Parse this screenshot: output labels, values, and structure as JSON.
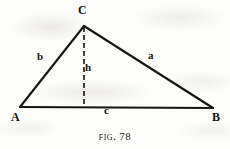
{
  "figure": {
    "caption_prefix": "Fig.",
    "caption_number": "78",
    "caption_full": "FIG. 78",
    "background_color": "#fdfdfb",
    "ink_color": "#16150f"
  },
  "diagram": {
    "type": "geometry-triangle-with-altitude",
    "canvas": {
      "width": 230,
      "height": 149
    },
    "vertices": [
      {
        "name": "A",
        "label": "A",
        "x": 20,
        "y": 107
      },
      {
        "name": "B",
        "label": "B",
        "x": 213,
        "y": 108
      },
      {
        "name": "C",
        "label": "C",
        "x": 84,
        "y": 26
      }
    ],
    "sides": [
      {
        "name": "side-a",
        "label": "a",
        "from": "C",
        "to": "B",
        "label_x": 152,
        "label_y": 56,
        "style": "solid"
      },
      {
        "name": "side-b",
        "label": "b",
        "from": "A",
        "to": "C",
        "label_x": 41,
        "label_y": 57,
        "style": "solid"
      },
      {
        "name": "side-c",
        "label": "c",
        "from": "A",
        "to": "B",
        "label_x": 108,
        "label_y": 111,
        "style": "solid"
      }
    ],
    "altitude": {
      "name": "altitude-h",
      "label": "h",
      "from": "C",
      "foot_x": 84,
      "foot_y": 107,
      "style": "dashed",
      "dash_pattern": "5,3"
    },
    "stroke_width": 2.1,
    "dash_stroke_width": 1.6
  }
}
